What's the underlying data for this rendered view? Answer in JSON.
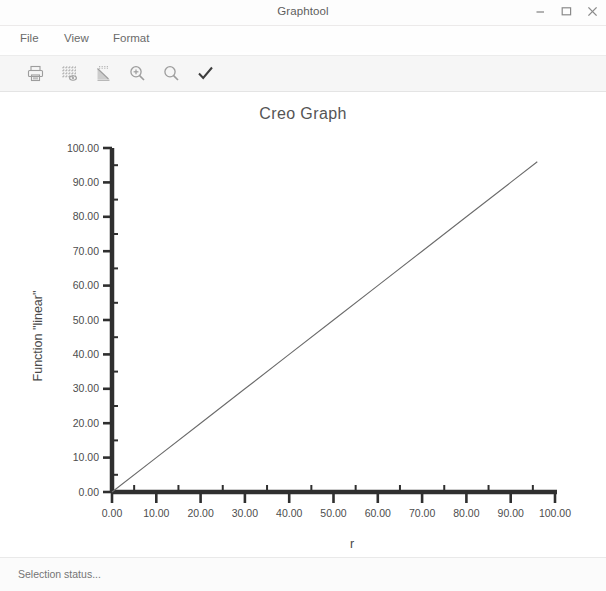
{
  "window": {
    "title": "Graphtool",
    "controls": [
      {
        "name": "minimize-button",
        "icon": "minimize-icon",
        "label": "–"
      },
      {
        "name": "maximize-button",
        "icon": "maximize-icon",
        "label": "□"
      },
      {
        "name": "close-button",
        "icon": "close-icon",
        "label": "✕"
      }
    ]
  },
  "menubar": {
    "items": [
      {
        "label": "File"
      },
      {
        "label": "View"
      },
      {
        "label": "Format"
      }
    ]
  },
  "toolbar": {
    "buttons": [
      {
        "name": "print-button",
        "icon": "printer-icon",
        "tooltip": "Print"
      },
      {
        "name": "grid-settings-button",
        "icon": "grid-icon",
        "tooltip": "Grid"
      },
      {
        "name": "graph-style-button",
        "icon": "graph-curve-icon",
        "tooltip": "Graph"
      },
      {
        "name": "zoom-in-button",
        "icon": "zoom-in-icon",
        "tooltip": "Zoom In"
      },
      {
        "name": "zoom-out-button",
        "icon": "zoom-out-icon",
        "tooltip": "Zoom Out"
      },
      {
        "name": "accept-button",
        "icon": "checkmark-icon",
        "tooltip": "Accept"
      }
    ]
  },
  "status": {
    "text": "Selection status..."
  },
  "chart_data": {
    "type": "line",
    "title": "Creo Graph",
    "xlabel": "r",
    "ylabel": "Function \"linear\"",
    "xlim": [
      0,
      100
    ],
    "ylim": [
      0,
      100
    ],
    "grid": false,
    "legend": false,
    "xticks": [
      0,
      10,
      20,
      30,
      40,
      50,
      60,
      70,
      80,
      90,
      100
    ],
    "yticks": [
      0,
      10,
      20,
      30,
      40,
      50,
      60,
      70,
      80,
      90,
      100
    ],
    "xtick_labels": [
      "0.00",
      "10.00",
      "20.00",
      "30.00",
      "40.00",
      "50.00",
      "60.00",
      "70.00",
      "80.00",
      "90.00",
      "100.00"
    ],
    "ytick_labels": [
      "0.00",
      "10.00",
      "20.00",
      "30.00",
      "40.00",
      "50.00",
      "60.00",
      "70.00",
      "80.00",
      "90.00",
      "100.00"
    ],
    "minor_tick_step": 5,
    "series": [
      {
        "name": "linear",
        "color": "#6b6b6b",
        "x": [
          0,
          10,
          20,
          30,
          40,
          50,
          60,
          70,
          80,
          90,
          96
        ],
        "y": [
          0,
          10,
          20,
          30,
          40,
          50,
          60,
          70,
          80,
          90,
          96
        ]
      }
    ]
  }
}
